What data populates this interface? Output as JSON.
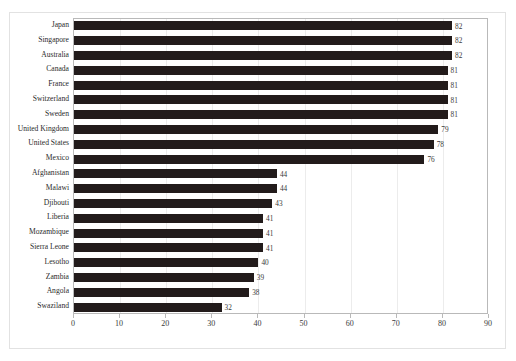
{
  "chart_data": {
    "type": "bar",
    "orientation": "horizontal",
    "title": "",
    "subtitle": "",
    "xlabel": "",
    "ylabel": "",
    "xlim": [
      0,
      90
    ],
    "xticks": [
      0,
      10,
      20,
      30,
      40,
      50,
      60,
      70,
      80,
      90
    ],
    "grid": true,
    "legend": false,
    "legend_position": "none",
    "bar_color": "#221b1b",
    "grid_color": "#ececec",
    "axis_color": "#b9b9b9",
    "frame_color": "#e2e2e2",
    "categories": [
      "Japan",
      "Singapore",
      "Australia",
      "Canada",
      "France",
      "Switzerland",
      "Sweden",
      "United Kingdom",
      "United States",
      "Mexico",
      "Afghanistan",
      "Malawi",
      "Djibouti",
      "Liberia",
      "Mozambique",
      "Sierra Leone",
      "Lesotho",
      "Zambia",
      "Angola",
      "Swaziland"
    ],
    "values": [
      82,
      82,
      82,
      81,
      81,
      81,
      81,
      79,
      78,
      76,
      44,
      44,
      43,
      41,
      41,
      41,
      40,
      39,
      38,
      32
    ],
    "value_labels": [
      "82",
      "82",
      "82",
      "81",
      "81",
      "81",
      "81",
      "79",
      "78",
      "76",
      "44",
      "44",
      "43",
      "41",
      "41",
      "41",
      "40",
      "39",
      "38",
      "32"
    ],
    "tick_labels": [
      "0",
      "10",
      "20",
      "30",
      "40",
      "50",
      "60",
      "70",
      "80",
      "90"
    ]
  }
}
